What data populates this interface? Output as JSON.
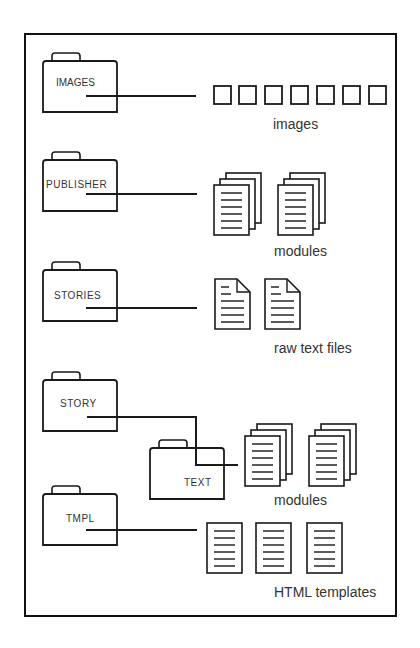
{
  "diagram": {
    "folders": [
      {
        "id": "images",
        "label": "IMAGES"
      },
      {
        "id": "publisher",
        "label": "PUBLISHER"
      },
      {
        "id": "stories",
        "label": "STORIES"
      },
      {
        "id": "story",
        "label": "STORY"
      },
      {
        "id": "text",
        "label": "TEXT"
      },
      {
        "id": "tmpl",
        "label": "TMPL"
      }
    ],
    "captions": {
      "images": "images",
      "publisher_modules": "modules",
      "raw_text": "raw text files",
      "text_modules": "modules",
      "templates": "HTML templates"
    },
    "counts": {
      "image_squares": 7,
      "publisher_module_stacks": 2,
      "raw_text_files": 2,
      "text_module_stacks": 2,
      "html_templates": 3
    },
    "colors": {
      "stroke": "#1a1a1a",
      "text": "#333333",
      "background": "#ffffff"
    }
  }
}
